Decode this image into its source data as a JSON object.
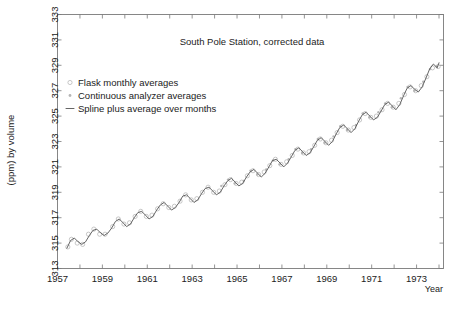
{
  "chart_data": {
    "type": "line",
    "title": "South Pole Station, corrected data",
    "xlabel": "Year",
    "ylabel": "(ppm) by volume",
    "xlim": [
      1957.0,
      1974.2
    ],
    "ylim": [
      313,
      333
    ],
    "grid": false,
    "legend_position": "upper-left-inside",
    "y_ticks": [
      313,
      315,
      317,
      319,
      321,
      323,
      325,
      327,
      329,
      331,
      333
    ],
    "y_tick_labels": [
      "313",
      "315",
      "317",
      "319",
      "321",
      "323",
      "325",
      "327",
      "329",
      "331",
      "333"
    ],
    "x_ticks": [
      1957,
      1958,
      1959,
      1960,
      1961,
      1962,
      1963,
      1964,
      1965,
      1966,
      1967,
      1968,
      1969,
      1970,
      1971,
      1972,
      1973,
      1974
    ],
    "x_tick_labels_shown": [
      "1957",
      "1959",
      "1961",
      "1963",
      "1965",
      "1967",
      "1969",
      "1971",
      "1973"
    ],
    "legend": [
      {
        "marker": "open-circle",
        "label": "Flask monthly averages"
      },
      {
        "marker": "small-dot",
        "label": "Continuous analyzer averages"
      },
      {
        "marker": "dash-line",
        "label": "Spline plus average over months"
      }
    ],
    "series": [
      {
        "name": "Spline plus average over months",
        "x": [
          1957.42,
          1957.58,
          1957.75,
          1957.92,
          1958.08,
          1958.25,
          1958.42,
          1958.58,
          1958.75,
          1958.92,
          1959.08,
          1959.25,
          1959.42,
          1959.58,
          1959.75,
          1959.92,
          1960.08,
          1960.25,
          1960.42,
          1960.58,
          1960.75,
          1960.92,
          1961.08,
          1961.25,
          1961.42,
          1961.58,
          1961.75,
          1961.92,
          1962.08,
          1962.25,
          1962.42,
          1962.58,
          1962.75,
          1962.92,
          1963.08,
          1963.25,
          1963.42,
          1963.58,
          1963.75,
          1963.92,
          1964.08,
          1964.25,
          1964.42,
          1964.58,
          1964.75,
          1964.92,
          1965.08,
          1965.25,
          1965.42,
          1965.58,
          1965.75,
          1965.92,
          1966.08,
          1966.25,
          1966.42,
          1966.58,
          1966.75,
          1966.92,
          1967.08,
          1967.25,
          1967.42,
          1967.58,
          1967.75,
          1967.92,
          1968.08,
          1968.25,
          1968.42,
          1968.58,
          1968.75,
          1968.92,
          1969.08,
          1969.25,
          1969.42,
          1969.58,
          1969.75,
          1969.92,
          1970.08,
          1970.25,
          1970.42,
          1970.58,
          1970.75,
          1970.92,
          1971.08,
          1971.25,
          1971.42,
          1971.58,
          1971.75,
          1971.92,
          1972.08,
          1972.25,
          1972.42,
          1972.58,
          1972.75,
          1972.92,
          1973.08,
          1973.25,
          1973.42,
          1973.58,
          1973.75,
          1973.92,
          1974.0
        ],
        "y": [
          314.6,
          315.2,
          315.4,
          315.1,
          314.9,
          315.1,
          315.6,
          316.0,
          316.1,
          315.8,
          315.6,
          315.8,
          316.2,
          316.7,
          316.9,
          316.6,
          316.3,
          316.5,
          317.0,
          317.4,
          317.5,
          317.2,
          316.9,
          317.1,
          317.6,
          318.0,
          318.2,
          317.9,
          317.6,
          317.8,
          318.2,
          318.7,
          318.8,
          318.5,
          318.2,
          318.4,
          318.9,
          319.3,
          319.4,
          319.1,
          318.8,
          319.0,
          319.5,
          319.9,
          320.1,
          319.8,
          319.5,
          319.7,
          320.2,
          320.6,
          320.8,
          320.5,
          320.2,
          320.5,
          321.0,
          321.5,
          321.6,
          321.3,
          321.0,
          321.3,
          321.8,
          322.3,
          322.5,
          322.2,
          321.9,
          322.1,
          322.6,
          323.1,
          323.3,
          323.0,
          322.7,
          323.0,
          323.6,
          324.1,
          324.3,
          324.0,
          323.7,
          324.0,
          324.6,
          325.1,
          325.3,
          325.0,
          324.7,
          324.9,
          325.4,
          325.9,
          326.1,
          325.8,
          325.5,
          325.9,
          326.6,
          327.2,
          327.4,
          327.1,
          326.9,
          327.3,
          328.0,
          328.7,
          329.1,
          328.8,
          329.2
        ],
        "color": "#4a4a4a"
      },
      {
        "name": "Flask monthly averages",
        "marker": "open-circle",
        "color": "#b0b0b0",
        "x": [
          1957.46,
          1957.62,
          1957.88,
          1958.12,
          1958.38,
          1958.62,
          1958.88,
          1959.12,
          1959.46,
          1959.71,
          1959.96,
          1960.21,
          1960.46,
          1960.71,
          1960.96,
          1961.21,
          1961.46,
          1961.71,
          1961.96,
          1962.21,
          1962.46,
          1962.71,
          1962.96,
          1963.21,
          1963.46,
          1963.71,
          1963.96,
          1964.21,
          1964.46,
          1964.71,
          1964.96,
          1965.21,
          1965.46,
          1965.71,
          1965.96,
          1966.21,
          1966.46,
          1966.71,
          1966.96,
          1967.21,
          1967.46,
          1967.71,
          1967.96,
          1968.21,
          1968.46,
          1968.71,
          1968.96,
          1969.21,
          1969.46,
          1969.71,
          1969.96,
          1970.21,
          1970.46,
          1970.71,
          1970.96,
          1971.21,
          1971.46,
          1971.71,
          1971.96,
          1972.21,
          1972.46,
          1972.71,
          1972.96,
          1973.21,
          1973.46,
          1973.71,
          1973.96
        ],
        "y": [
          314.7,
          315.3,
          315.0,
          314.9,
          315.7,
          316.1,
          315.7,
          315.7,
          316.3,
          316.9,
          316.5,
          316.6,
          317.1,
          317.5,
          317.1,
          317.2,
          317.7,
          318.1,
          317.8,
          317.9,
          318.3,
          318.8,
          318.4,
          318.5,
          319.0,
          319.4,
          319.0,
          319.1,
          319.6,
          320.0,
          319.7,
          319.8,
          320.3,
          320.7,
          320.4,
          320.6,
          321.1,
          321.6,
          321.2,
          321.4,
          321.9,
          322.4,
          322.1,
          322.2,
          322.7,
          323.2,
          322.9,
          323.1,
          323.7,
          324.2,
          323.9,
          324.1,
          324.7,
          325.2,
          324.9,
          325.0,
          325.5,
          326.0,
          325.7,
          326.0,
          326.7,
          327.3,
          327.0,
          327.4,
          328.1,
          328.8,
          328.9
        ],
        "note": "light grey open circles scattered along the spline"
      },
      {
        "name": "Continuous analyzer averages",
        "marker": "small-dot",
        "color": "#b5b5b5",
        "x": [
          1964.3,
          1964.6,
          1964.9,
          1965.3,
          1965.6,
          1965.9,
          1966.3,
          1966.6,
          1966.9,
          1967.3,
          1967.6,
          1967.9,
          1968.3,
          1968.6,
          1968.9,
          1969.3,
          1969.6,
          1969.9,
          1970.3,
          1970.6,
          1970.9,
          1971.3,
          1971.6,
          1971.9,
          1972.3,
          1972.6,
          1972.9,
          1973.3,
          1973.6,
          1973.9
        ],
        "y": [
          319.5,
          320.0,
          319.7,
          319.9,
          320.7,
          320.4,
          320.8,
          321.5,
          321.2,
          321.6,
          322.4,
          322.1,
          322.4,
          323.2,
          322.9,
          323.4,
          324.2,
          323.9,
          324.3,
          325.2,
          324.9,
          325.3,
          326.0,
          325.7,
          326.4,
          327.3,
          327.0,
          327.7,
          328.7,
          328.9
        ],
        "note": "small light grey dots, mostly from mid-1960s onward"
      }
    ]
  }
}
